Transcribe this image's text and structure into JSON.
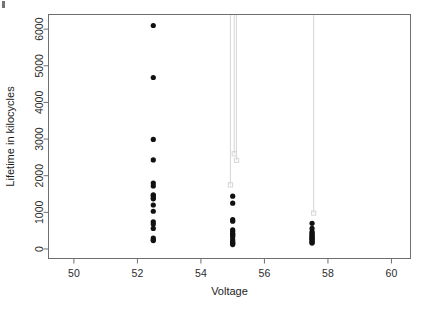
{
  "figure": {
    "kind": "scatter-plot",
    "background": "#ffffff",
    "frame_color": "#6f6f6f",
    "point_color": "#111111",
    "censor_color": "#d9d9d9"
  },
  "chart_data": {
    "type": "scatter",
    "title": "",
    "xlabel": "Voltage",
    "ylabel": "Lifetime in kilocycles",
    "xlim": [
      49.2,
      60.6
    ],
    "ylim": [
      -260,
      6400
    ],
    "xticks": [
      50,
      52,
      54,
      56,
      58,
      60
    ],
    "yticks": [
      0,
      1000,
      2000,
      3000,
      4000,
      5000,
      6000
    ],
    "xtick_labels": [
      "50",
      "52",
      "54",
      "56",
      "58",
      "60"
    ],
    "ytick_labels": [
      "0",
      "1000",
      "2000",
      "3000",
      "4000",
      "5000",
      "6000"
    ],
    "grid": false,
    "legend": false,
    "series": [
      {
        "name": "Failures",
        "marker": "filled-circle",
        "color": "#111111",
        "points": [
          {
            "x": 52.5,
            "y": 6100
          },
          {
            "x": 52.5,
            "y": 4680
          },
          {
            "x": 52.5,
            "y": 2990
          },
          {
            "x": 52.5,
            "y": 2430
          },
          {
            "x": 52.5,
            "y": 1800
          },
          {
            "x": 52.5,
            "y": 1720
          },
          {
            "x": 52.5,
            "y": 1480
          },
          {
            "x": 52.5,
            "y": 1460
          },
          {
            "x": 52.5,
            "y": 1400
          },
          {
            "x": 52.5,
            "y": 1370
          },
          {
            "x": 52.5,
            "y": 1200
          },
          {
            "x": 52.5,
            "y": 1030
          },
          {
            "x": 52.5,
            "y": 740
          },
          {
            "x": 52.5,
            "y": 680
          },
          {
            "x": 52.5,
            "y": 560
          },
          {
            "x": 52.5,
            "y": 300
          },
          {
            "x": 52.5,
            "y": 250
          },
          {
            "x": 52.5,
            "y": 230
          },
          {
            "x": 55.0,
            "y": 1440
          },
          {
            "x": 55.0,
            "y": 1250
          },
          {
            "x": 55.0,
            "y": 800
          },
          {
            "x": 55.0,
            "y": 760
          },
          {
            "x": 55.0,
            "y": 520
          },
          {
            "x": 55.0,
            "y": 480
          },
          {
            "x": 55.0,
            "y": 420
          },
          {
            "x": 55.0,
            "y": 400
          },
          {
            "x": 55.0,
            "y": 360
          },
          {
            "x": 55.0,
            "y": 330
          },
          {
            "x": 55.0,
            "y": 250
          },
          {
            "x": 55.0,
            "y": 200
          },
          {
            "x": 55.0,
            "y": 170
          },
          {
            "x": 55.0,
            "y": 150
          },
          {
            "x": 55.0,
            "y": 120
          },
          {
            "x": 57.5,
            "y": 700
          },
          {
            "x": 57.5,
            "y": 560
          },
          {
            "x": 57.5,
            "y": 470
          },
          {
            "x": 57.5,
            "y": 430
          },
          {
            "x": 57.5,
            "y": 390
          },
          {
            "x": 57.5,
            "y": 360
          },
          {
            "x": 57.5,
            "y": 330
          },
          {
            "x": 57.5,
            "y": 300
          },
          {
            "x": 57.5,
            "y": 270
          },
          {
            "x": 57.5,
            "y": 250
          },
          {
            "x": 57.5,
            "y": 210
          },
          {
            "x": 57.5,
            "y": 180
          },
          {
            "x": 57.5,
            "y": 160
          }
        ]
      },
      {
        "name": "Censored",
        "marker": "open-square-with-line",
        "color": "#d9d9d9",
        "points": [
          {
            "x": 54.93,
            "y": 1750
          },
          {
            "x": 55.05,
            "y": 2600
          },
          {
            "x": 55.12,
            "y": 2420
          },
          {
            "x": 57.55,
            "y": 980
          }
        ]
      }
    ]
  }
}
